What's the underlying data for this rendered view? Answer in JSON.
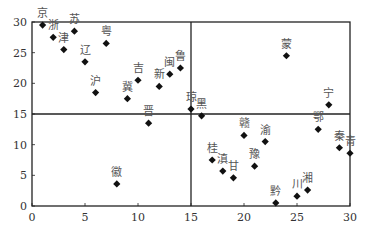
{
  "chart_data": {
    "type": "scatter",
    "title": "",
    "xlabel": "",
    "ylabel": "",
    "xlim": [
      0,
      30
    ],
    "ylim": [
      0,
      30
    ],
    "xticks": [
      0,
      5,
      10,
      15,
      20,
      25,
      30
    ],
    "yticks": [
      0,
      5,
      10,
      15,
      20,
      25,
      30
    ],
    "grid": false,
    "legend": null,
    "reference_lines": {
      "x": 15,
      "y": 15
    },
    "marker": "diamond",
    "points": [
      {
        "label": "京",
        "x": 1,
        "y": 29.5
      },
      {
        "label": "浙",
        "x": 2,
        "y": 27.5
      },
      {
        "label": "津",
        "x": 3,
        "y": 25.5
      },
      {
        "label": "苏",
        "x": 4,
        "y": 28.5
      },
      {
        "label": "辽",
        "x": 5,
        "y": 23.5
      },
      {
        "label": "沪",
        "x": 6,
        "y": 18.5
      },
      {
        "label": "粤",
        "x": 7,
        "y": 26.5
      },
      {
        "label": "徽",
        "x": 8,
        "y": 3.6
      },
      {
        "label": "冀",
        "x": 9,
        "y": 17.5
      },
      {
        "label": "吉",
        "x": 10,
        "y": 20.5
      },
      {
        "label": "晋",
        "x": 11,
        "y": 13.5
      },
      {
        "label": "新",
        "x": 12,
        "y": 19.5
      },
      {
        "label": "闽",
        "x": 13,
        "y": 21.5
      },
      {
        "label": "鲁",
        "x": 14,
        "y": 22.5
      },
      {
        "label": "琼",
        "x": 15,
        "y": 15.8
      },
      {
        "label": "黑",
        "x": 16,
        "y": 14.7
      },
      {
        "label": "桂",
        "x": 17,
        "y": 7.5
      },
      {
        "label": "滇",
        "x": 18,
        "y": 5.7
      },
      {
        "label": "甘",
        "x": 19,
        "y": 4.6
      },
      {
        "label": "赣",
        "x": 20,
        "y": 11.5
      },
      {
        "label": "豫",
        "x": 21,
        "y": 6.5
      },
      {
        "label": "渝",
        "x": 22,
        "y": 10.5
      },
      {
        "label": "黔",
        "x": 23,
        "y": 0.5
      },
      {
        "label": "蒙",
        "x": 24,
        "y": 24.5
      },
      {
        "label": "川",
        "x": 25,
        "y": 1.6
      },
      {
        "label": "湘",
        "x": 26,
        "y": 2.6
      },
      {
        "label": "鄂",
        "x": 27,
        "y": 12.5
      },
      {
        "label": "宁",
        "x": 28,
        "y": 16.5
      },
      {
        "label": "秦",
        "x": 29,
        "y": 9.5
      },
      {
        "label": "青",
        "x": 30,
        "y": 8.6
      }
    ]
  },
  "colors": {
    "axis": "#222222",
    "marker": "#111111",
    "label": "#555555",
    "tick": "#333333"
  }
}
